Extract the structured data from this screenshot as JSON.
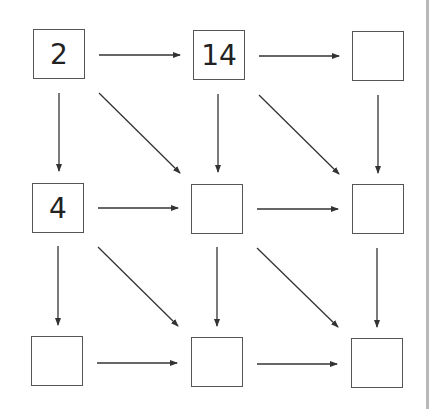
{
  "diagram": {
    "type": "3x3 grid with right, down, and diagonal arrows",
    "colors": {
      "box_border": "#555555",
      "arrow": "#333333",
      "text": "#222222",
      "edge_bar": "#b8b8b8"
    },
    "cells": [
      {
        "row": 0,
        "col": 0,
        "value": "2"
      },
      {
        "row": 0,
        "col": 1,
        "value": "14"
      },
      {
        "row": 0,
        "col": 2,
        "value": ""
      },
      {
        "row": 1,
        "col": 0,
        "value": "4"
      },
      {
        "row": 1,
        "col": 1,
        "value": ""
      },
      {
        "row": 1,
        "col": 2,
        "value": ""
      },
      {
        "row": 2,
        "col": 0,
        "value": ""
      },
      {
        "row": 2,
        "col": 1,
        "value": ""
      },
      {
        "row": 2,
        "col": 2,
        "value": ""
      }
    ]
  }
}
